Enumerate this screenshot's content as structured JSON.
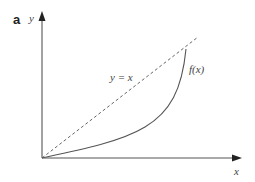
{
  "figure": {
    "panel_label": "a",
    "y_axis_label": "y",
    "x_axis_label": "x",
    "identity_line_label": "y = x",
    "curve_label": "f(x)"
  },
  "colors": {
    "axis": "#555555",
    "curve": "#555555",
    "dashed_line": "#666666",
    "text": "#444444"
  }
}
